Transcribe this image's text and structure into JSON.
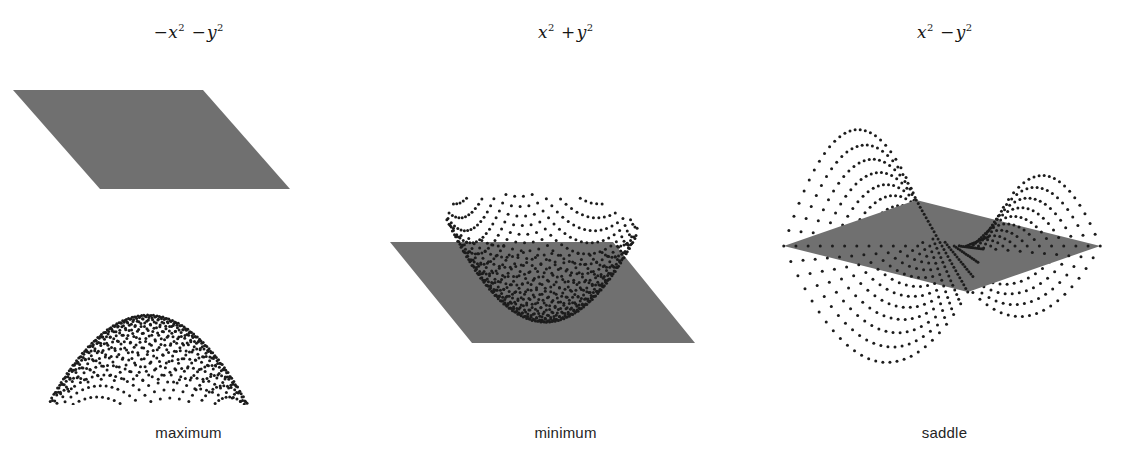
{
  "figure": {
    "title": "",
    "background_color": "#ffffff",
    "panel_count": 3
  },
  "panels": [
    {
      "id": "maximum",
      "formula_base1": "−x",
      "formula_exp1": "2",
      "formula_op": "−",
      "formula_base2": "y",
      "formula_exp2": "2",
      "formula_plain": "−x² −y²",
      "caption": "maximum",
      "surface_type": "paraboloid-down",
      "plane_position": "above",
      "dot_color": "#1c1c1c",
      "plane_color": "#707070"
    },
    {
      "id": "minimum",
      "formula_base1": "x",
      "formula_exp1": "2",
      "formula_op": "+",
      "formula_base2": "y",
      "formula_exp2": "2",
      "formula_plain": "x² +y²",
      "caption": "minimum",
      "surface_type": "paraboloid-up",
      "plane_position": "below",
      "dot_color": "#1c1c1c",
      "plane_color": "#707070"
    },
    {
      "id": "saddle",
      "formula_base1": "x",
      "formula_exp1": "2",
      "formula_op": "−",
      "formula_base2": "y",
      "formula_exp2": "2",
      "formula_plain": "x² −y²",
      "caption": "saddle",
      "surface_type": "hyperbolic-paraboloid",
      "plane_position": "through",
      "dot_color": "#1c1c1c",
      "plane_color": "#707070"
    }
  ],
  "chart_data": {
    "type": "scatter",
    "title": "",
    "xlabel": "",
    "ylabel": "",
    "panels": [
      {
        "name": "maximum",
        "function": "z = -x^2 - y^2",
        "surface": "downward paraboloid",
        "tangent_plane": "z = 0 (horizontal plane touching the surface at its peak, drawn above the dotted cap)",
        "critical_point": [
          0,
          0,
          0
        ],
        "classification": "local maximum",
        "domain_x": [
          -1,
          1
        ],
        "domain_y": [
          -1,
          1
        ],
        "zlim": [
          -2,
          0
        ]
      },
      {
        "name": "minimum",
        "function": "z = x^2 + y^2",
        "surface": "upward paraboloid (bowl)",
        "tangent_plane": "z = 0 (horizontal plane touching the bowl at its lowest point)",
        "critical_point": [
          0,
          0,
          0
        ],
        "classification": "local minimum",
        "domain_x": [
          -1,
          1
        ],
        "domain_y": [
          -1,
          1
        ],
        "zlim": [
          0,
          2
        ]
      },
      {
        "name": "saddle",
        "function": "z = x^2 - y^2",
        "surface": "hyperbolic paraboloid with two rising humps at left and right and two falling lobes front and back",
        "tangent_plane": "z = 0 (horizontal plane cutting through the surface at the saddle point)",
        "critical_point": [
          0,
          0,
          0
        ],
        "classification": "saddle point",
        "domain_x": [
          -1,
          1
        ],
        "domain_y": [
          -1,
          1
        ],
        "zlim": [
          -1,
          1
        ]
      }
    ]
  }
}
